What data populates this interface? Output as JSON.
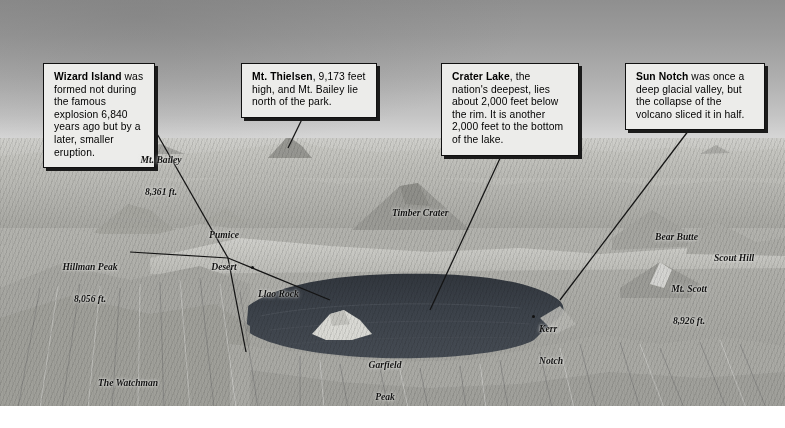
{
  "image": {
    "title": "Crater Lake National Park — annotated bird's-eye panorama",
    "width": 785,
    "height": 428
  },
  "callouts": [
    {
      "id": "wizard-island",
      "term": "Wizard Island",
      "text": " was formed not during the famous explosion 6,840 years ago but by a later, smaller eruption."
    },
    {
      "id": "mt-thielsen",
      "term": "Mt. Thielsen",
      "text": ", 9,173 feet high, and Mt. Bailey lie north of the park."
    },
    {
      "id": "crater-lake",
      "term": "Crater Lake",
      "text": ", the nation's deepest, lies about 2,000 feet below the rim. It is another 2,000 feet to the bottom of the lake."
    },
    {
      "id": "sun-notch",
      "term": "Sun Notch",
      "text": " was once a deep glacial valley, but the collapse of the volcano sliced it in half."
    }
  ],
  "map_labels": [
    {
      "id": "mt-bailey",
      "name": "Mt. Bailey",
      "elevation": "8,361 ft."
    },
    {
      "id": "pumice-desert",
      "name": "Pumice",
      "elevation": "Desert"
    },
    {
      "id": "hillman-peak",
      "name": "Hillman Peak",
      "elevation": "8,056 ft."
    },
    {
      "id": "llao-rock",
      "name": "Llao Rock",
      "elevation": ""
    },
    {
      "id": "the-watchman",
      "name": "The Watchman",
      "elevation": ""
    },
    {
      "id": "garfield-peak",
      "name": "Garfield",
      "elevation": "Peak"
    },
    {
      "id": "timber-crater",
      "name": "Timber Crater",
      "elevation": ""
    },
    {
      "id": "bear-butte",
      "name": "Bear Butte",
      "elevation": ""
    },
    {
      "id": "scout-hill",
      "name": "Scout Hill",
      "elevation": ""
    },
    {
      "id": "mt-scott",
      "name": "Mt. Scott",
      "elevation": "8,926 ft."
    },
    {
      "id": "kerr-notch",
      "name": "Kerr",
      "elevation": "Notch"
    }
  ],
  "colors": {
    "sky_top": "#8f8f8f",
    "sky_bottom": "#e4e4e4",
    "terrain_base": "#b2b2ad",
    "lake_water": "#3a3f46",
    "callout_fill": "#ececea",
    "ink": "#111111"
  }
}
